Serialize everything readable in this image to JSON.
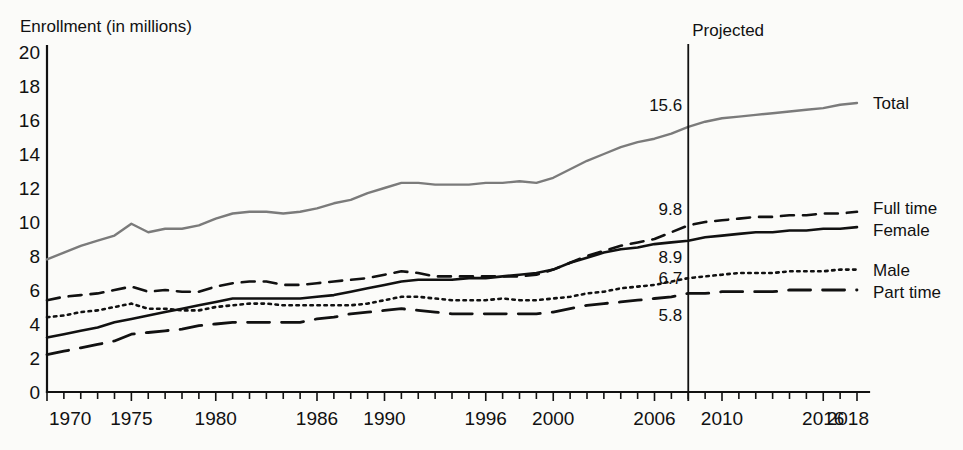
{
  "chart_data": {
    "type": "line",
    "title": "",
    "ylabel": "Enrollment (in millions)",
    "xlabel": "",
    "ylim": [
      0,
      20
    ],
    "ytick_step": 2,
    "xlim": [
      1970,
      2018
    ],
    "grid": false,
    "legend_position": "right-inline",
    "yticks": [
      "0",
      "2",
      "4",
      "6",
      "8",
      "10",
      "12",
      "14",
      "16",
      "18",
      "20"
    ],
    "xticks": [
      "1970",
      "1975",
      "1980",
      "1986",
      "1990",
      "1996",
      "2000",
      "2006",
      "2010",
      "2016",
      "2018"
    ],
    "xtick_years": [
      1970,
      1975,
      1980,
      1986,
      1990,
      1996,
      2000,
      2006,
      2010,
      2016,
      2018
    ],
    "annotations": [
      {
        "name": "projected-marker",
        "text": "Projected",
        "year": 2008
      }
    ],
    "value_labels": [
      {
        "series": "Total",
        "value": "15.6",
        "year": 2008,
        "y": 15.6
      },
      {
        "series": "Full time",
        "value": "9.8",
        "year": 2008,
        "y": 9.8
      },
      {
        "series": "Female",
        "value": "8.9",
        "year": 2008,
        "y": 8.9
      },
      {
        "series": "Male",
        "value": "6.7",
        "year": 2008,
        "y": 6.7
      },
      {
        "series": "Part time",
        "value": "5.8",
        "year": 2008,
        "y": 5.8
      }
    ],
    "x": [
      1970,
      1971,
      1972,
      1973,
      1974,
      1975,
      1976,
      1977,
      1978,
      1979,
      1980,
      1981,
      1982,
      1983,
      1984,
      1985,
      1986,
      1987,
      1988,
      1989,
      1990,
      1991,
      1992,
      1993,
      1994,
      1995,
      1996,
      1997,
      1998,
      1999,
      2000,
      2001,
      2002,
      2003,
      2004,
      2005,
      2006,
      2007,
      2008,
      2009,
      2010,
      2011,
      2012,
      2013,
      2014,
      2015,
      2016,
      2017,
      2018
    ],
    "series": [
      {
        "name": "Total",
        "style": "solid",
        "color": "#7b7b7b",
        "width": 2.4,
        "values": [
          7.8,
          8.2,
          8.6,
          8.9,
          9.2,
          9.9,
          9.4,
          9.6,
          9.6,
          9.8,
          10.2,
          10.5,
          10.6,
          10.6,
          10.5,
          10.6,
          10.8,
          11.1,
          11.3,
          11.7,
          12.0,
          12.3,
          12.3,
          12.2,
          12.2,
          12.2,
          12.3,
          12.3,
          12.4,
          12.3,
          12.6,
          13.1,
          13.6,
          14.0,
          14.4,
          14.7,
          14.9,
          15.2,
          15.6,
          15.9,
          16.1,
          16.2,
          16.3,
          16.4,
          16.5,
          16.6,
          16.7,
          16.9,
          17.0
        ]
      },
      {
        "name": "Full time",
        "style": "dashed",
        "color": "#111111",
        "width": 2.6,
        "values": [
          5.4,
          5.6,
          5.7,
          5.8,
          6.0,
          6.2,
          5.9,
          6.0,
          5.9,
          5.9,
          6.2,
          6.4,
          6.5,
          6.5,
          6.3,
          6.3,
          6.4,
          6.5,
          6.6,
          6.7,
          6.9,
          7.1,
          7.0,
          6.8,
          6.8,
          6.8,
          6.8,
          6.8,
          6.8,
          6.9,
          7.2,
          7.6,
          8.0,
          8.3,
          8.6,
          8.8,
          9.0,
          9.4,
          9.8,
          10.0,
          10.1,
          10.2,
          10.3,
          10.3,
          10.4,
          10.4,
          10.5,
          10.5,
          10.6
        ]
      },
      {
        "name": "Female",
        "style": "solid",
        "color": "#111111",
        "width": 2.6,
        "values": [
          3.2,
          3.4,
          3.6,
          3.8,
          4.1,
          4.3,
          4.5,
          4.7,
          4.9,
          5.1,
          5.3,
          5.5,
          5.5,
          5.5,
          5.5,
          5.5,
          5.6,
          5.7,
          5.9,
          6.1,
          6.3,
          6.5,
          6.6,
          6.6,
          6.6,
          6.7,
          6.7,
          6.8,
          6.9,
          7.0,
          7.2,
          7.6,
          7.9,
          8.2,
          8.4,
          8.5,
          8.7,
          8.8,
          8.9,
          9.1,
          9.2,
          9.3,
          9.4,
          9.4,
          9.5,
          9.5,
          9.6,
          9.6,
          9.7
        ]
      },
      {
        "name": "Male",
        "style": "dotted",
        "color": "#111111",
        "width": 2.6,
        "values": [
          4.4,
          4.5,
          4.7,
          4.8,
          5.0,
          5.2,
          4.9,
          4.9,
          4.8,
          4.8,
          5.0,
          5.1,
          5.2,
          5.2,
          5.1,
          5.1,
          5.1,
          5.1,
          5.1,
          5.2,
          5.4,
          5.6,
          5.6,
          5.5,
          5.4,
          5.4,
          5.4,
          5.5,
          5.4,
          5.4,
          5.5,
          5.6,
          5.8,
          5.9,
          6.1,
          6.2,
          6.3,
          6.5,
          6.7,
          6.8,
          6.9,
          7.0,
          7.0,
          7.0,
          7.1,
          7.1,
          7.1,
          7.2,
          7.2
        ]
      },
      {
        "name": "Part time",
        "style": "longdash",
        "color": "#111111",
        "width": 2.8,
        "values": [
          2.2,
          2.4,
          2.6,
          2.8,
          3.0,
          3.4,
          3.5,
          3.6,
          3.7,
          3.9,
          4.0,
          4.1,
          4.1,
          4.1,
          4.1,
          4.1,
          4.3,
          4.4,
          4.6,
          4.7,
          4.8,
          4.9,
          4.8,
          4.7,
          4.6,
          4.6,
          4.6,
          4.6,
          4.6,
          4.6,
          4.7,
          4.9,
          5.1,
          5.2,
          5.3,
          5.4,
          5.5,
          5.6,
          5.8,
          5.8,
          5.9,
          5.9,
          5.9,
          5.9,
          6.0,
          6.0,
          6.0,
          6.0,
          6.0
        ]
      }
    ],
    "series_labels": [
      {
        "name": "Total",
        "text": "Total"
      },
      {
        "name": "Full time",
        "text": "Full time"
      },
      {
        "name": "Female",
        "text": "Female"
      },
      {
        "name": "Male",
        "text": "Male"
      },
      {
        "name": "Part time",
        "text": "Part time"
      }
    ]
  }
}
